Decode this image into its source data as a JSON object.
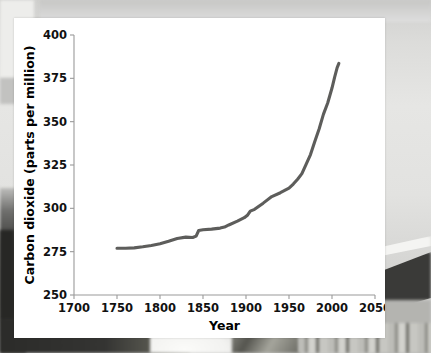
{
  "figure": {
    "background_color": "#ffffff",
    "page_background_color": "#d8d8d6"
  },
  "chart_data": {
    "type": "line",
    "title": "",
    "subtitle": "",
    "xlabel": "Year",
    "ylabel": "Carbon dioxide (parts per million)",
    "xlim": [
      1700,
      2050
    ],
    "ylim": [
      250,
      400
    ],
    "xticks": [
      1700,
      1750,
      1800,
      1850,
      1900,
      1950,
      2000,
      2050
    ],
    "xtick_labels": [
      "1700",
      "1750",
      "1800",
      "1850",
      "1900",
      "1950",
      "2000",
      "2050"
    ],
    "yticks": [
      250,
      275,
      300,
      325,
      350,
      375,
      400
    ],
    "ytick_labels": [
      "250",
      "275",
      "300",
      "325",
      "350",
      "375",
      "400"
    ],
    "grid": false,
    "legend": null,
    "legend_position": "none",
    "line_color": "#5d5d5b",
    "line_width": 3.1,
    "series": [
      {
        "name": "Atmospheric carbon dioxide",
        "x": [
          1750,
          1760,
          1770,
          1780,
          1790,
          1800,
          1810,
          1820,
          1830,
          1838,
          1842,
          1845,
          1850,
          1860,
          1870,
          1875,
          1880,
          1890,
          1898,
          1902,
          1905,
          1910,
          1920,
          1930,
          1940,
          1950,
          1955,
          1960,
          1965,
          1970,
          1975,
          1980,
          1985,
          1990,
          1995,
          2000,
          2003,
          2006,
          2008
        ],
        "y": [
          277.0,
          277.0,
          277.2,
          277.8,
          278.6,
          279.6,
          281.0,
          282.6,
          283.4,
          283.2,
          284.0,
          287.2,
          287.6,
          288.0,
          288.6,
          289.2,
          290.4,
          292.6,
          294.6,
          296.2,
          298.4,
          299.4,
          303.0,
          306.8,
          309.0,
          311.6,
          314.0,
          316.8,
          320.0,
          325.5,
          331.0,
          338.6,
          345.8,
          354.2,
          360.8,
          369.4,
          375.6,
          381.2,
          383.6
        ]
      }
    ]
  }
}
